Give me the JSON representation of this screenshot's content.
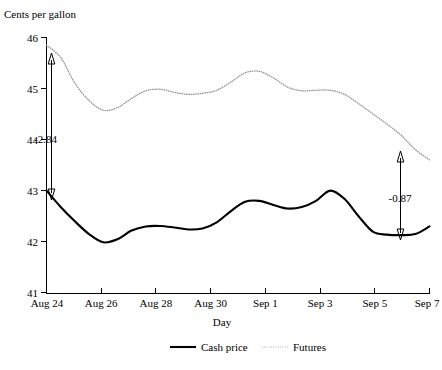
{
  "chart_data": {
    "type": "line",
    "title": "",
    "ylabel": "Cents per gallon",
    "xlabel": "Day",
    "ylim": [
      41,
      46
    ],
    "yticks": [
      41,
      42,
      43,
      44,
      45,
      46
    ],
    "ytick_labels": [
      "41",
      "42",
      "43",
      "44",
      "45",
      "46"
    ],
    "xticks": [
      "Aug 24",
      "Aug 26",
      "Aug 28",
      "Aug 30",
      "Sep 1",
      "Sep 3",
      "Sep 5",
      "Sep 7"
    ],
    "xlim": [
      "Aug 24",
      "Sep 7"
    ],
    "grid": false,
    "legend_position": "bottom",
    "series": [
      {
        "name": "Cash price",
        "style": "solid",
        "color": "#000000",
        "x": [
          "Aug 24",
          "Aug 24.5",
          "Aug 25",
          "Aug 25.5",
          "Aug 26",
          "Aug 26.5",
          "Aug 27",
          "Aug 27.5",
          "Aug 28",
          "Aug 28.5",
          "Aug 29",
          "Aug 29.5",
          "Aug 30",
          "Aug 30.5",
          "Aug 31",
          "Sep 1",
          "Sep 1.5",
          "Sep 2",
          "Sep 2.5",
          "Sep 3",
          "Sep 3.5",
          "Sep 4",
          "Sep 4.5",
          "Sep 5",
          "Sep 5.5",
          "Sep 6",
          "Sep 6.5",
          "Sep 7"
        ],
        "values": [
          43.0,
          42.68,
          42.4,
          42.15,
          41.99,
          42.05,
          42.22,
          42.3,
          42.31,
          42.28,
          42.24,
          42.26,
          42.38,
          42.6,
          42.78,
          42.8,
          42.72,
          42.65,
          42.68,
          42.8,
          43.0,
          42.84,
          42.5,
          42.2,
          42.14,
          42.13,
          42.15,
          42.3
        ]
      },
      {
        "name": "Futures",
        "style": "dotted",
        "color": "#8e8e8e",
        "x": [
          "Aug 24",
          "Aug 24.5",
          "Aug 25",
          "Aug 25.5",
          "Aug 26",
          "Aug 26.5",
          "Aug 27",
          "Aug 27.5",
          "Aug 28",
          "Aug 28.5",
          "Aug 29",
          "Aug 29.5",
          "Aug 30",
          "Aug 30.5",
          "Aug 31",
          "Sep 1",
          "Sep 1.5",
          "Sep 2",
          "Sep 2.5",
          "Sep 3",
          "Sep 3.5",
          "Sep 4",
          "Sep 4.5",
          "Sep 5",
          "Sep 5.5",
          "Sep 6",
          "Sep 6.5",
          "Sep 7"
        ],
        "values": [
          45.84,
          45.6,
          45.1,
          44.76,
          44.57,
          44.62,
          44.8,
          44.95,
          44.98,
          44.92,
          44.88,
          44.9,
          44.96,
          45.12,
          45.3,
          45.33,
          45.2,
          45.02,
          44.95,
          44.96,
          44.96,
          44.88,
          44.7,
          44.5,
          44.3,
          44.08,
          43.8,
          43.6
        ]
      }
    ],
    "annotations": [
      {
        "label": "-2.84",
        "type": "double-arrow-vertical",
        "x": "Aug 24.2",
        "y_top": 45.72,
        "y_bottom": 42.95,
        "label_y": 44.0
      },
      {
        "label": "-0.87",
        "type": "double-arrow-vertical",
        "x": "Sep 6.2",
        "y_top": 43.98,
        "y_bottom": 42.2,
        "label_y": 43.1
      }
    ]
  },
  "legend": {
    "items": [
      {
        "label": "Cash price",
        "style": "solid"
      },
      {
        "label": "Futures",
        "style": "dotted"
      }
    ]
  }
}
